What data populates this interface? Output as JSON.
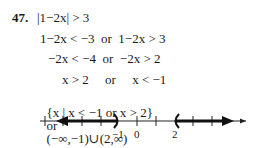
{
  "problem": {
    "number": "47.",
    "statement": "|1−2x| > 3",
    "steps": [
      "1−2x < −3  or  1−2x > 3",
      "−2x < −4  or  −2x > 2",
      "x > 2     or     x < −1"
    ],
    "answer_set_builder": "{x | x < −1 or x > 2}",
    "answer_connector": "or",
    "answer_interval": "(−∞,−1)∪(2,∞)"
  },
  "number_line": {
    "labels": [
      {
        "text": "−1",
        "value": -1
      },
      {
        "text": "0",
        "value": 0
      },
      {
        "text": "2",
        "value": 2
      }
    ],
    "open_endpoints": [
      -1,
      2
    ],
    "shaded_regions": [
      "x < -1",
      "x > 2"
    ]
  }
}
